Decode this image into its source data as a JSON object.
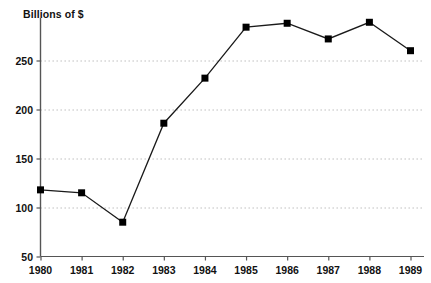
{
  "chart_data": {
    "type": "line",
    "title": "Billions of $",
    "xlabel": "",
    "ylabel": "",
    "categories": [
      "1980",
      "1981",
      "1982",
      "1983",
      "1984",
      "1985",
      "1986",
      "1987",
      "1988",
      "1989"
    ],
    "values": [
      118,
      115,
      85,
      186,
      232,
      284,
      288,
      272,
      289,
      260
    ],
    "series": [
      {
        "name": "Billions of $",
        "values": [
          118,
          115,
          85,
          186,
          232,
          284,
          288,
          272,
          289,
          260
        ]
      }
    ],
    "xlim": [
      1980,
      1989
    ],
    "ylim": [
      50,
      300
    ],
    "ytick_labels": [
      "250",
      "200",
      "150",
      "100",
      "50"
    ],
    "ytick_values": [
      250,
      200,
      150,
      100,
      50
    ],
    "xtick_labels": [
      "1980",
      "1981",
      "1982",
      "1983",
      "1984",
      "1985",
      "1986",
      "1987",
      "1988",
      "1989"
    ],
    "grid": "horizontal-dotted",
    "legend": "none",
    "marker": "square",
    "line_color": "#1a1a1a",
    "marker_color": "#000000",
    "grid_color": "#b9b9b9",
    "axis_color": "#555555",
    "background_color": "#ffffff"
  }
}
